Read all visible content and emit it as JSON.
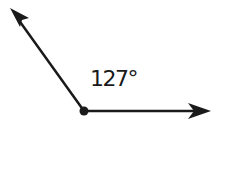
{
  "diagram": {
    "type": "angle",
    "label": "127°",
    "measure_degrees": 127,
    "colors": {
      "stroke": "#1a1a1a",
      "background": "#ffffff"
    },
    "vertex": {
      "x": 84,
      "y": 111
    },
    "rays": [
      {
        "name": "upper-left-ray",
        "tip": {
          "x": 10,
          "y": 8
        }
      },
      {
        "name": "right-ray",
        "tip": {
          "x": 211,
          "y": 111
        }
      }
    ]
  }
}
